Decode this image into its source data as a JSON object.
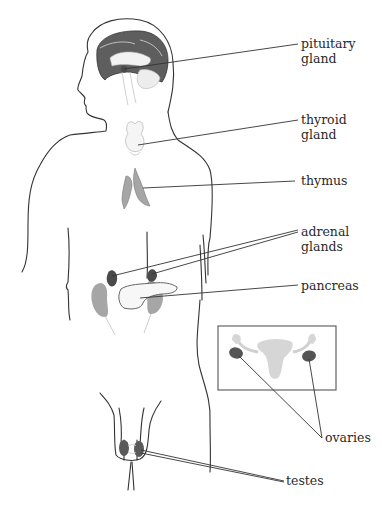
{
  "diagram": {
    "labels": {
      "pituitary": [
        "pituitary",
        "gland"
      ],
      "thyroid": [
        "thyroid",
        "gland"
      ],
      "thymus": [
        "thymus"
      ],
      "adrenal": [
        "adrenal",
        "glands"
      ],
      "pancreas": [
        "pancreas"
      ],
      "ovaries": [
        "ovaries"
      ],
      "testes": [
        "testes"
      ]
    },
    "colors": {
      "outline": "#333333",
      "brain_dark": "#5e5e5e",
      "organ_gray": "#a6a6a6",
      "light_gray": "#d4d4d4",
      "gland_dark": "#4a4a4a",
      "inset_border": "#555555"
    }
  }
}
